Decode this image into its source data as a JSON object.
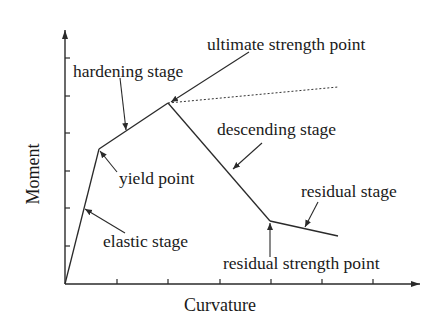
{
  "diagram": {
    "axes": {
      "x_label": "Curvature",
      "y_label": "Moment",
      "x_ticks": 6,
      "y_ticks": 6
    },
    "curve_points": [
      {
        "name": "origin",
        "x": 65,
        "y": 284
      },
      {
        "name": "yield point",
        "x": 99,
        "y": 149
      },
      {
        "name": "ultimate strength point",
        "x": 168,
        "y": 103
      },
      {
        "name": "residual strength point",
        "x": 270,
        "y": 221
      },
      {
        "name": "end",
        "x": 338,
        "y": 236
      }
    ],
    "dotted_extension": {
      "from": [
        168,
        103
      ],
      "to": [
        338,
        87
      ]
    },
    "labels": {
      "ultimate_strength_point": "ultimate strength point",
      "hardening_stage": "hardening stage",
      "descending_stage": "descending stage",
      "yield_point": "yield point",
      "residual_stage": "residual stage",
      "elastic_stage": "elastic stage",
      "residual_strength_point": "residual strength point"
    }
  }
}
